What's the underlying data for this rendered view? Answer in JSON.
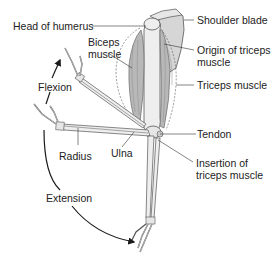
{
  "diagram": {
    "colors": {
      "muscle": "#b8b8b8",
      "muscle_dark": "#8c8c8c",
      "bone": "#eeeeee",
      "bone_stroke": "#555555",
      "scapula": "#d6d6d6",
      "arrow": "#1a1a1a",
      "leader": "#333333",
      "text": "#222222"
    },
    "labels": {
      "head_of_humerus": "Head of humerus",
      "biceps_line1": "Biceps",
      "biceps_line2": "muscle",
      "shoulder_blade": "Shoulder blade",
      "origin_triceps_line1": "Origin of triceps",
      "origin_triceps_line2": "muscle",
      "triceps_muscle": "Triceps muscle",
      "flexion": "Flexion",
      "tendon": "Tendon",
      "radius": "Radius",
      "ulna": "Ulna",
      "insertion_line1": "Insertion of",
      "insertion_line2": "triceps muscle",
      "extension": "Extension"
    }
  }
}
